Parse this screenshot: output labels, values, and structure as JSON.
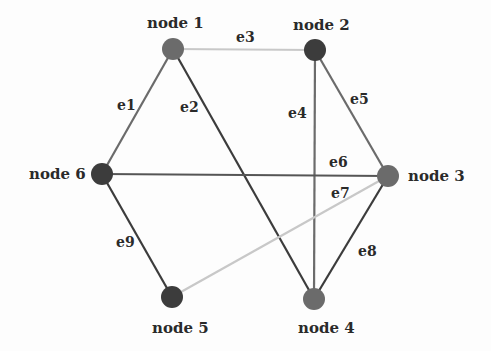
{
  "diagram": {
    "type": "graph",
    "nodes": [
      {
        "id": "node1",
        "label": "node 1",
        "x": 173,
        "y": 49,
        "color": "#6b6b6b"
      },
      {
        "id": "node2",
        "label": "node 2",
        "x": 315,
        "y": 50,
        "color": "#3c3c3c"
      },
      {
        "id": "node3",
        "label": "node 3",
        "x": 388,
        "y": 176,
        "color": "#6b6b6b"
      },
      {
        "id": "node4",
        "label": "node 4",
        "x": 314,
        "y": 299,
        "color": "#6b6b6b"
      },
      {
        "id": "node5",
        "label": "node 5",
        "x": 172,
        "y": 297,
        "color": "#3c3c3c"
      },
      {
        "id": "node6",
        "label": "node 6",
        "x": 102,
        "y": 174,
        "color": "#3c3c3c"
      }
    ],
    "edges": [
      {
        "id": "e1",
        "label": "e1",
        "from": "node1",
        "to": "node6",
        "color": "#6b6b6b"
      },
      {
        "id": "e2",
        "label": "e2",
        "from": "node1",
        "to": "node4",
        "color": "#3c3c3c"
      },
      {
        "id": "e3",
        "label": "e3",
        "from": "node1",
        "to": "node2",
        "color": "#c8c8c8"
      },
      {
        "id": "e4",
        "label": "e4",
        "from": "node2",
        "to": "node4",
        "color": "#6b6b6b"
      },
      {
        "id": "e5",
        "label": "e5",
        "from": "node2",
        "to": "node3",
        "color": "#6b6b6b"
      },
      {
        "id": "e6",
        "label": "e6",
        "from": "node6",
        "to": "node3",
        "color": "#555555"
      },
      {
        "id": "e7",
        "label": "e7",
        "from": "node3",
        "to": "node5",
        "color": "#c8c8c8"
      },
      {
        "id": "e8",
        "label": "e8",
        "from": "node3",
        "to": "node4",
        "color": "#3c3c3c"
      },
      {
        "id": "e9",
        "label": "e9",
        "from": "node6",
        "to": "node5",
        "color": "#3c3c3c"
      }
    ]
  }
}
